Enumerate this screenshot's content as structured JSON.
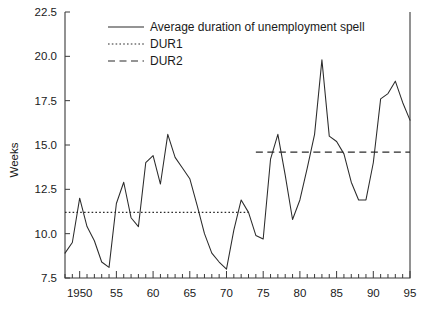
{
  "chart_data": {
    "type": "line",
    "title": "",
    "xlabel": "",
    "ylabel": "Weeks",
    "xlim": [
      1948,
      1995
    ],
    "ylim": [
      7.5,
      22.5
    ],
    "grid": false,
    "legend_position": "top-center",
    "y_ticks": [
      "7.5",
      "10.0",
      "12.5",
      "15.0",
      "17.5",
      "20.0",
      "22.5"
    ],
    "y_tick_values": [
      7.5,
      10.0,
      12.5,
      15.0,
      17.5,
      20.0,
      22.5
    ],
    "x_ticks": [
      "1950",
      "55",
      "60",
      "65",
      "70",
      "75",
      "80",
      "85",
      "90",
      "95"
    ],
    "x_tick_values": [
      1950,
      1955,
      1960,
      1965,
      1970,
      1975,
      1980,
      1985,
      1990,
      1995
    ],
    "x_minor_step": 1,
    "series": [
      {
        "name": "Average duration of unemployment spell",
        "style": "solid",
        "x": [
          1948,
          1949,
          1950,
          1951,
          1952,
          1953,
          1954,
          1955,
          1956,
          1957,
          1958,
          1959,
          1960,
          1961,
          1962,
          1963,
          1964,
          1965,
          1966,
          1967,
          1968,
          1969,
          1970,
          1971,
          1972,
          1973,
          1974,
          1975,
          1976,
          1977,
          1978,
          1979,
          1980,
          1981,
          1982,
          1983,
          1984,
          1985,
          1986,
          1987,
          1988,
          1989,
          1990,
          1991,
          1992,
          1993,
          1994,
          1995
        ],
        "values": [
          8.9,
          9.5,
          12.0,
          10.4,
          9.6,
          8.4,
          8.1,
          11.7,
          12.9,
          10.9,
          10.4,
          14.0,
          14.4,
          12.8,
          15.6,
          14.3,
          13.7,
          13.1,
          11.6,
          10.0,
          8.9,
          8.4,
          8.0,
          10.2,
          11.9,
          11.2,
          9.9,
          9.7,
          14.2,
          15.6,
          13.3,
          10.8,
          11.9,
          13.7,
          15.6,
          19.8,
          15.5,
          15.2,
          14.5,
          12.9,
          11.9,
          11.9,
          14.0,
          17.6,
          17.9,
          18.6,
          17.4,
          16.4
        ]
      },
      {
        "name": "DUR1",
        "style": "dotted",
        "level": 11.2,
        "x_start": 1948,
        "x_end": 1973
      },
      {
        "name": "DUR2",
        "style": "dashed",
        "level": 14.6,
        "x_start": 1974,
        "x_end": 1995
      }
    ]
  },
  "legend": {
    "items": [
      {
        "label": "Average duration of unemployment spell",
        "style": "solid"
      },
      {
        "label": "DUR1",
        "style": "dotted"
      },
      {
        "label": "DUR2",
        "style": "dashed"
      }
    ]
  }
}
